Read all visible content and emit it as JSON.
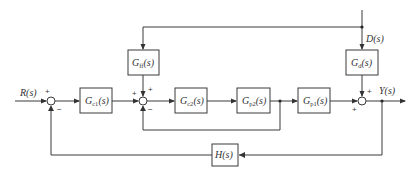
{
  "diagram": {
    "type": "control-block-diagram",
    "signals": {
      "input": "R(s)",
      "output": "Y(s)",
      "disturbance": "D(s)"
    },
    "blocks": [
      {
        "id": "gc1",
        "G": "G",
        "sub": "c1",
        "arg": "(s)"
      },
      {
        "id": "gff",
        "G": "G",
        "sub": "ff",
        "arg": "(s)"
      },
      {
        "id": "gc2",
        "G": "G",
        "sub": "c2",
        "arg": "(s)"
      },
      {
        "id": "gp2",
        "G": "G",
        "sub": "p2",
        "arg": "(s)"
      },
      {
        "id": "gp1",
        "G": "G",
        "sub": "p1",
        "arg": "(s)"
      },
      {
        "id": "gd",
        "G": "G",
        "sub": "d",
        "arg": "(s)"
      },
      {
        "id": "h",
        "label": "H(s)"
      }
    ],
    "summing_junctions": [
      {
        "id": "sum1",
        "signs": {
          "top": "+",
          "bottom": "−"
        }
      },
      {
        "id": "sum2",
        "signs": {
          "left": "+",
          "top": "+",
          "bottom": "−"
        }
      },
      {
        "id": "sum3",
        "signs": {
          "top": "+",
          "left": "+"
        }
      }
    ]
  }
}
